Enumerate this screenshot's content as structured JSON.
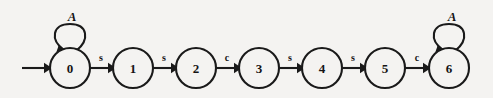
{
  "diagram": {
    "background_color": "#f4f3f1",
    "ink_color": "#1a1a1a",
    "states": [
      {
        "id": "0",
        "label": "0",
        "cx": 70,
        "cy": 68,
        "r": 20
      },
      {
        "id": "1",
        "label": "1",
        "cx": 133,
        "cy": 68,
        "r": 20
      },
      {
        "id": "2",
        "label": "2",
        "cx": 196,
        "cy": 68,
        "r": 20
      },
      {
        "id": "3",
        "label": "3",
        "cx": 259,
        "cy": 68,
        "r": 20
      },
      {
        "id": "4",
        "label": "4",
        "cx": 322,
        "cy": 68,
        "r": 20
      },
      {
        "id": "5",
        "label": "5",
        "cx": 385,
        "cy": 68,
        "r": 20
      },
      {
        "id": "6",
        "label": "6",
        "cx": 449,
        "cy": 68,
        "r": 20
      }
    ],
    "start_arrow": {
      "label": "start-arrow",
      "x1": 22,
      "x2": 49,
      "y": 68
    },
    "transitions": [
      {
        "from": "0",
        "to": "1",
        "label": "s",
        "lx": 101,
        "ly": 57
      },
      {
        "from": "1",
        "to": "2",
        "label": "s",
        "lx": 164,
        "ly": 57
      },
      {
        "from": "2",
        "to": "3",
        "label": "c",
        "lx": 227,
        "ly": 57
      },
      {
        "from": "3",
        "to": "4",
        "label": "s",
        "lx": 290,
        "ly": 57
      },
      {
        "from": "4",
        "to": "5",
        "label": "s",
        "lx": 353,
        "ly": 57
      },
      {
        "from": "5",
        "to": "6",
        "label": "c",
        "lx": 417,
        "ly": 57
      }
    ],
    "self_loops": [
      {
        "state": "0",
        "label": "A",
        "lx": 72,
        "ly": 16
      },
      {
        "state": "6",
        "label": "A",
        "lx": 452,
        "ly": 16
      }
    ]
  }
}
